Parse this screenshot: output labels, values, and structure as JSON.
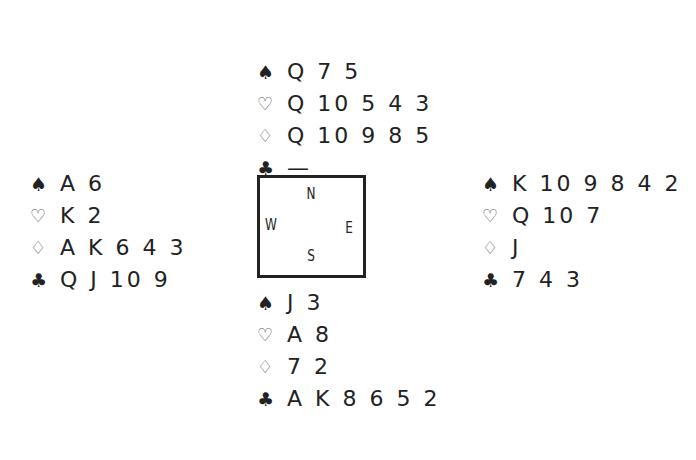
{
  "suits": {
    "spade": "♠",
    "heart": "♡",
    "diamond": "♢",
    "club": "♣"
  },
  "compass": {
    "north": "N",
    "south": "S",
    "east": "E",
    "west": "W"
  },
  "hands": {
    "north": {
      "spades": "Q 7 5",
      "hearts": "Q 10 5 4 3",
      "diamonds": "Q 10 9 8 5",
      "clubs": "—"
    },
    "west": {
      "spades": "A 6",
      "hearts": "K 2",
      "diamonds": "A K 6 4 3",
      "clubs": "Q J 10 9"
    },
    "east": {
      "spades": "K 10 9 8 4 2",
      "hearts": "Q 10 7",
      "diamonds": "J",
      "clubs": "7 4 3"
    },
    "south": {
      "spades": "J 3",
      "hearts": "A 8",
      "diamonds": "7 2",
      "clubs": "A K 8 6 5 2"
    }
  }
}
